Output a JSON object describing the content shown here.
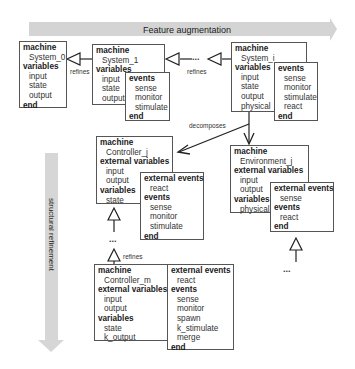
{
  "banner": {
    "label": "Feature augmentation",
    "color": "#d4d4d4"
  },
  "side_arrow": {
    "label": "structural refinement",
    "color": "#d4d4d4"
  },
  "machines": {
    "system_0": {
      "kw_machine": "machine",
      "name": "System_0",
      "kw_variables": "variables",
      "variables": [
        "input",
        "state",
        "output"
      ],
      "kw_end": "end"
    },
    "system_1": {
      "kw_machine": "machine",
      "name": "System_1",
      "kw_variables": "variables",
      "variables": [
        "input",
        "state",
        "output"
      ],
      "kw_events": "events",
      "events": [
        "sense",
        "monitor",
        "stimulate"
      ],
      "kw_end": "end"
    },
    "system_i": {
      "kw_machine": "machine",
      "name": "System_i",
      "kw_variables": "variables",
      "variables": [
        "input",
        "state",
        "output",
        "physical"
      ],
      "kw_events": "events",
      "events": [
        "sense",
        "monitor",
        "stimulate",
        "react"
      ],
      "kw_end": "end"
    },
    "controller_j": {
      "kw_machine": "machine",
      "name": "Controller_j",
      "kw_ext_variables": "external variables",
      "ext_variables": [
        "input",
        "output"
      ],
      "kw_variables": "variables",
      "variables": [
        "state"
      ],
      "kw_ext_events": "external events",
      "ext_events": [
        "react"
      ],
      "kw_events": "events",
      "events": [
        "sense",
        "monitor",
        "stimulate"
      ],
      "kw_end": "end"
    },
    "environment_j": {
      "kw_machine": "machine",
      "name": "Environment_j",
      "kw_ext_variables": "external variables",
      "ext_variables": [
        "input",
        "output"
      ],
      "kw_variables": "variables",
      "variables": [
        "physical"
      ],
      "kw_ext_events": "external events",
      "ext_events": [
        "sense"
      ],
      "kw_events": "events",
      "events": [
        "react"
      ],
      "kw_end": "end"
    },
    "controller_m": {
      "kw_machine": "machine",
      "name": "Controller_m",
      "kw_ext_variables": "external variables",
      "ext_variables": [
        "input",
        "output"
      ],
      "kw_variables": "variables",
      "variables": [
        "state",
        "k_output"
      ],
      "kw_ext_events": "external events",
      "ext_events": [
        "react"
      ],
      "kw_events": "events",
      "events": [
        "sense",
        "monitor",
        "spawn",
        "k_stimulate",
        "merge"
      ],
      "kw_end": "end"
    }
  },
  "labels": {
    "refines_1": "refines",
    "refines_2": "refines",
    "refines_3": "refines",
    "decomposes": "decomposes",
    "ellipsis_top": "...",
    "ellipsis_ctrl": "...",
    "ellipsis_env": "..."
  }
}
